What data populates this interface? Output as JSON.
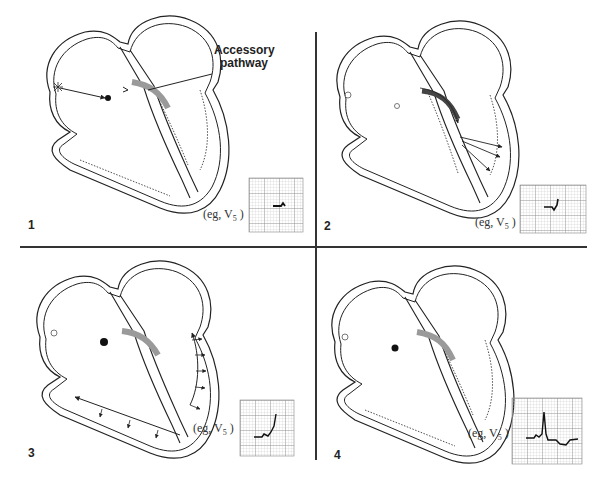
{
  "figure": {
    "panels": [
      {
        "number": "1",
        "ecg_label_prefix": "(eg, V",
        "ecg_label_sub": "5",
        "ecg_label_suffix": " )",
        "callout_line1": "Accessory",
        "callout_line2": "pathway"
      },
      {
        "number": "2",
        "ecg_label_prefix": "(eg, V",
        "ecg_label_sub": "5",
        "ecg_label_suffix": " )"
      },
      {
        "number": "3",
        "ecg_label_prefix": "(eg, V",
        "ecg_label_sub": "5",
        "ecg_label_suffix": " )"
      },
      {
        "number": "4",
        "ecg_label_prefix": "(eg, V",
        "ecg_label_sub": "5",
        "ecg_label_suffix": " )"
      }
    ],
    "colors": {
      "line": "#222222",
      "accessory_pathway": "#9a9a9a",
      "ecg_grid": "#b5b5b5",
      "divider": "#333333"
    }
  }
}
